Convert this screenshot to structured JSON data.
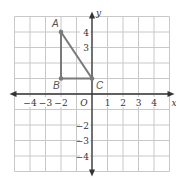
{
  "figure": {
    "axes": {
      "x_label": "x",
      "y_label": "y",
      "origin_label": "O",
      "range": [
        -5,
        5
      ]
    },
    "x_ticks": [
      {
        "v": -4,
        "t": "−4"
      },
      {
        "v": -3,
        "t": "−3"
      },
      {
        "v": -2,
        "t": "−2"
      },
      {
        "v": 1,
        "t": "1"
      },
      {
        "v": 2,
        "t": "2"
      },
      {
        "v": 3,
        "t": "3"
      },
      {
        "v": 4,
        "t": "4"
      }
    ],
    "y_ticks": [
      {
        "v": 4,
        "t": "4"
      },
      {
        "v": 3,
        "t": "3"
      },
      {
        "v": -2,
        "t": "−2"
      },
      {
        "v": -3,
        "t": "−3"
      },
      {
        "v": -4,
        "t": "−4"
      }
    ],
    "points": [
      {
        "name": "A",
        "x": -2,
        "y": 4
      },
      {
        "name": "B",
        "x": -2,
        "y": 1
      },
      {
        "name": "C",
        "x": 0,
        "y": 1
      }
    ],
    "colors": {
      "grid": "#c8c8c8",
      "axis": "#333333",
      "triangle": "#7a7a7a"
    }
  }
}
